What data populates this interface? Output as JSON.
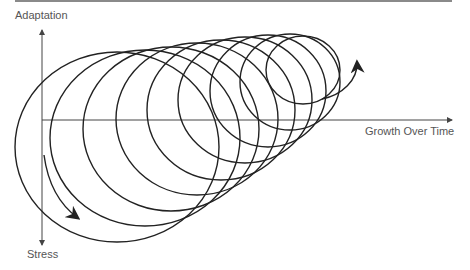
{
  "diagram": {
    "title": "",
    "axes": {
      "y_positive_label": "Adaptation",
      "y_negative_label": "Stress",
      "x_label": "Growth Over Time"
    },
    "spiral": {
      "loops": 9,
      "description": "Helical spiral starting near the origin, looping clockwise with progressively smaller loops drifting up and to the right, ending in an upward arrow"
    },
    "colors": {
      "stroke": "#222222",
      "axis": "#444444",
      "label": "#555555",
      "top_rule": "#8a8a8a"
    }
  }
}
